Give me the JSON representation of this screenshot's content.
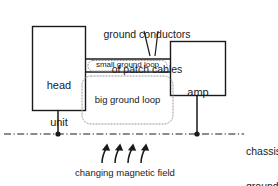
{
  "diagram": {
    "title_callout": {
      "line1": "ground conductors",
      "line2": "of patch cables"
    },
    "blocks": [
      {
        "id": "head-unit",
        "line1": "head",
        "line2": "unit"
      },
      {
        "id": "amp",
        "line1": "amp",
        "line2": ""
      }
    ],
    "loops": [
      {
        "id": "small-ground-loop",
        "label": "small ground loop"
      },
      {
        "id": "big-ground-loop",
        "label": "big ground loop"
      }
    ],
    "chassis_ground": {
      "line1": "chassis",
      "line2": "ground"
    },
    "magnetic_field": {
      "label": "changing magnetic field",
      "arrow_count": 4
    },
    "colors": {
      "stroke": "#1a1a1a",
      "loop_dotted": "#9a9a9a",
      "background": "#ffffff",
      "text": "#1a1a1a"
    }
  }
}
